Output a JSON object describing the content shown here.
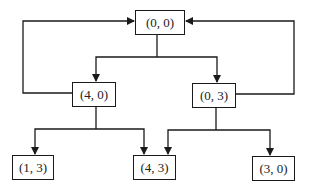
{
  "diagram": {
    "type": "state-transition-graph",
    "nodes": [
      {
        "id": "n00",
        "label": "(0, 0)"
      },
      {
        "id": "n40",
        "label": "(4, 0)"
      },
      {
        "id": "n03",
        "label": "(0, 3)"
      },
      {
        "id": "n13",
        "label": "(1, 3)"
      },
      {
        "id": "n43",
        "label": "(4, 3)"
      },
      {
        "id": "n30",
        "label": "(3, 0)"
      }
    ],
    "edges": [
      {
        "from": "(0, 0)",
        "to": "(4, 0)"
      },
      {
        "from": "(0, 0)",
        "to": "(0, 3)"
      },
      {
        "from": "(4, 0)",
        "to": "(0, 0)"
      },
      {
        "from": "(0, 3)",
        "to": "(0, 0)"
      },
      {
        "from": "(4, 0)",
        "to": "(1, 3)"
      },
      {
        "from": "(4, 0)",
        "to": "(4, 3)"
      },
      {
        "from": "(0, 3)",
        "to": "(4, 3)"
      },
      {
        "from": "(0, 3)",
        "to": "(3, 0)"
      }
    ],
    "colors": {
      "stroke": "#1a1a1a",
      "background": "#ffffff"
    }
  }
}
